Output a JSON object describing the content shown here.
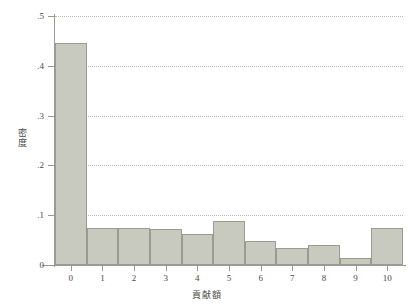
{
  "chart_data": {
    "type": "bar",
    "title": "",
    "subtitle": "",
    "xlabel": "貢献額",
    "ylabel": "密度",
    "categories": [
      "0",
      "1",
      "2",
      "3",
      "4",
      "5",
      "6",
      "7",
      "8",
      "9",
      "10"
    ],
    "values": [
      0.445,
      0.074,
      0.074,
      0.073,
      0.062,
      0.088,
      0.049,
      0.035,
      0.041,
      0.015,
      0.074
    ],
    "series": [
      {
        "name": "密度",
        "values": [
          0.445,
          0.074,
          0.074,
          0.073,
          0.062,
          0.088,
          0.049,
          0.035,
          0.041,
          0.015,
          0.074
        ]
      }
    ],
    "xlim": [
      -0.5,
      10.5
    ],
    "ylim": [
      0,
      0.5
    ],
    "y_ticks": [
      0,
      0.1,
      0.2,
      0.3,
      0.4,
      0.5
    ],
    "y_tick_labels": [
      "0",
      ".1",
      ".2",
      ".3",
      ".4",
      ".5"
    ],
    "x_ticks": [
      0,
      1,
      2,
      3,
      4,
      5,
      6,
      7,
      8,
      9,
      10
    ],
    "x_tick_labels": [
      "0",
      "1",
      "2",
      "3",
      "4",
      "5",
      "6",
      "7",
      "8",
      "9",
      "10"
    ],
    "grid": "horizontal-dotted",
    "legend": "none",
    "bar_fill_color": "#c8cabf",
    "bar_edge_color": "#9a9c92",
    "gridline_color": "#b9b9b0",
    "axis_color": "#9a9a92",
    "text_color": "#4a4a46",
    "background_color": "#ffffff",
    "annotations": []
  }
}
